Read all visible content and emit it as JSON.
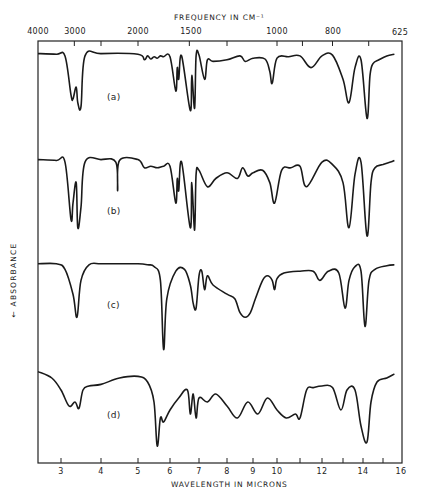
{
  "chart_data": {
    "type": "line",
    "title": "FREQUENCY IN CM⁻¹",
    "xlabel": "WAVELENGTH IN MICRONS",
    "ylabel": "← ABSORBANCE",
    "top_axis": {
      "label": "FREQUENCY IN CM⁻¹",
      "ticks": [
        "4000",
        "3000",
        "2000",
        "1500",
        "1000",
        "800",
        "625"
      ]
    },
    "bottom_axis": {
      "label": "WAVELENGTH IN MICRONS",
      "tick_labels": [
        "3",
        "4",
        "5",
        "6",
        "7",
        "8",
        "9",
        "10",
        "12",
        "14",
        "16"
      ],
      "minor_ticks": [
        11,
        13,
        15
      ],
      "xlim": [
        2.5,
        16
      ]
    },
    "grid": false,
    "legend": "none (inline labels a-d)",
    "series": [
      {
        "name": "(a)",
        "x_microns": [
          2.5,
          2.9,
          3.1,
          3.25,
          3.3,
          3.38,
          3.42,
          3.5,
          3.6,
          4.0,
          5.0,
          5.2,
          5.3,
          5.4,
          5.5,
          5.6,
          5.7,
          5.8,
          6.0,
          6.2,
          6.25,
          6.3,
          6.4,
          6.7,
          6.75,
          6.85,
          6.9,
          7.0,
          7.2,
          7.3,
          7.5,
          8.0,
          8.5,
          8.7,
          9.0,
          9.5,
          9.7,
          9.8,
          10.0,
          10.5,
          11.0,
          11.5,
          12.0,
          12.5,
          13.0,
          13.3,
          13.6,
          13.9,
          14.2,
          14.35,
          14.5,
          14.8,
          15.2,
          15.6
        ],
        "absorbance_relative": [
          0.02,
          0.03,
          0.05,
          0.55,
          0.6,
          0.45,
          0.65,
          0.7,
          0.05,
          0.02,
          0.03,
          0.1,
          0.05,
          0.09,
          0.06,
          0.08,
          0.05,
          0.06,
          0.06,
          0.5,
          0.2,
          0.35,
          0.05,
          0.75,
          0.3,
          0.72,
          0.05,
          0.04,
          0.35,
          0.1,
          0.12,
          0.1,
          0.05,
          0.12,
          0.08,
          0.09,
          0.25,
          0.4,
          0.08,
          0.06,
          0.05,
          0.2,
          0.05,
          0.04,
          0.35,
          0.65,
          0.2,
          0.1,
          0.85,
          0.3,
          0.15,
          0.1,
          0.05,
          0.03
        ]
      },
      {
        "name": "(b)",
        "x_microns": [
          2.5,
          2.9,
          3.1,
          3.25,
          3.3,
          3.38,
          3.42,
          3.5,
          3.6,
          4.0,
          4.4,
          4.45,
          4.5,
          5.0,
          5.2,
          5.4,
          5.6,
          5.8,
          6.0,
          6.2,
          6.25,
          6.3,
          6.4,
          6.7,
          6.75,
          6.85,
          6.9,
          7.0,
          7.3,
          7.6,
          8.0,
          8.4,
          8.6,
          8.8,
          9.0,
          9.4,
          9.7,
          9.9,
          10.2,
          10.6,
          11.0,
          11.3,
          12.0,
          12.5,
          13.0,
          13.3,
          13.6,
          13.9,
          14.2,
          14.4,
          14.6,
          15.0,
          15.4,
          15.6
        ],
        "absorbance_relative": [
          0.02,
          0.03,
          0.05,
          0.75,
          0.55,
          0.3,
          0.85,
          0.6,
          0.05,
          0.02,
          0.05,
          0.4,
          0.03,
          0.02,
          0.12,
          0.1,
          0.12,
          0.1,
          0.1,
          0.55,
          0.25,
          0.4,
          0.05,
          0.85,
          0.3,
          0.88,
          0.2,
          0.15,
          0.35,
          0.25,
          0.18,
          0.25,
          0.12,
          0.22,
          0.18,
          0.15,
          0.3,
          0.55,
          0.15,
          0.12,
          0.1,
          0.35,
          0.05,
          0.08,
          0.3,
          0.85,
          0.2,
          0.05,
          0.95,
          0.3,
          0.12,
          0.08,
          0.05,
          0.03
        ]
      },
      {
        "name": "(c)",
        "x_microns": [
          2.5,
          2.9,
          3.1,
          3.3,
          3.4,
          3.5,
          3.7,
          4.0,
          4.5,
          5.0,
          5.3,
          5.5,
          5.7,
          5.8,
          5.9,
          6.2,
          6.5,
          6.7,
          6.8,
          6.9,
          7.0,
          7.1,
          7.2,
          7.3,
          7.5,
          8.0,
          8.3,
          8.5,
          8.7,
          8.9,
          9.1,
          9.4,
          9.6,
          9.8,
          9.9,
          10.0,
          10.3,
          11.0,
          11.6,
          11.9,
          12.3,
          12.8,
          13.1,
          13.3,
          13.6,
          13.9,
          14.1,
          14.3,
          14.6,
          15.2,
          15.6
        ],
        "absorbance_relative": [
          0.02,
          0.02,
          0.08,
          0.35,
          0.6,
          0.2,
          0.03,
          0.02,
          0.02,
          0.02,
          0.03,
          0.05,
          0.2,
          0.95,
          0.4,
          0.1,
          0.08,
          0.25,
          0.45,
          0.5,
          0.15,
          0.1,
          0.3,
          0.15,
          0.25,
          0.35,
          0.4,
          0.55,
          0.6,
          0.55,
          0.4,
          0.2,
          0.15,
          0.2,
          0.3,
          0.18,
          0.12,
          0.1,
          0.1,
          0.2,
          0.1,
          0.12,
          0.5,
          0.2,
          0.05,
          0.1,
          0.7,
          0.2,
          0.08,
          0.04,
          0.03
        ]
      },
      {
        "name": "(d)",
        "x_microns": [
          2.5,
          2.8,
          3.0,
          3.2,
          3.35,
          3.45,
          3.55,
          3.7,
          4.0,
          4.5,
          5.0,
          5.3,
          5.5,
          5.6,
          5.7,
          5.8,
          6.0,
          6.3,
          6.6,
          6.7,
          6.8,
          6.9,
          7.0,
          7.3,
          7.6,
          8.0,
          8.4,
          8.8,
          9.2,
          9.6,
          10.0,
          10.4,
          10.8,
          11.0,
          11.3,
          11.6,
          12.0,
          12.5,
          12.9,
          13.2,
          13.6,
          13.9,
          14.2,
          14.4,
          14.7,
          15.2,
          15.6
        ],
        "absorbance_relative": [
          0.02,
          0.1,
          0.25,
          0.45,
          0.4,
          0.48,
          0.25,
          0.2,
          0.18,
          0.1,
          0.08,
          0.15,
          0.4,
          0.95,
          0.6,
          0.65,
          0.5,
          0.35,
          0.25,
          0.55,
          0.3,
          0.6,
          0.35,
          0.4,
          0.3,
          0.45,
          0.6,
          0.4,
          0.55,
          0.35,
          0.5,
          0.6,
          0.55,
          0.6,
          0.25,
          0.22,
          0.2,
          0.22,
          0.5,
          0.25,
          0.25,
          0.7,
          0.9,
          0.4,
          0.15,
          0.1,
          0.05
        ]
      }
    ]
  },
  "labels": {
    "top_title": "FREQUENCY IN CM⁻¹",
    "bottom_title": "WAVELENGTH IN MICRONS",
    "y_title": "← ABSORBANCE",
    "series_a": "(a)",
    "series_b": "(b)",
    "series_c": "(c)",
    "series_d": "(d)",
    "top_ticks": [
      "4000",
      "3000",
      "2000",
      "1500",
      "1000",
      "800",
      "625"
    ],
    "bottom_ticks": [
      "3",
      "4",
      "5",
      "6",
      "7",
      "8",
      "9",
      "10",
      "12",
      "14",
      "16"
    ]
  }
}
